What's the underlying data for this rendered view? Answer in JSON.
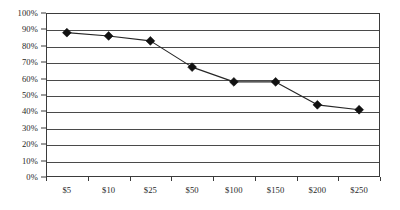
{
  "chart_data": {
    "type": "line",
    "title": "",
    "subtitle": "",
    "xlabel": "",
    "ylabel": "",
    "categories": [
      "$5",
      "$10",
      "$25",
      "$50",
      "$100",
      "$150",
      "$200",
      "$250"
    ],
    "values": [
      88,
      86,
      83,
      67,
      58,
      58,
      44,
      41
    ],
    "value_unit": "%",
    "series": [
      {
        "name": "",
        "values": [
          88,
          86,
          83,
          67,
          58,
          58,
          44,
          41
        ]
      }
    ],
    "ylim": [
      0,
      100
    ],
    "ytick_labels": [
      "0%",
      "10%",
      "20%",
      "30%",
      "40%",
      "50%",
      "60%",
      "70%",
      "80%",
      "90%",
      "100%"
    ],
    "ytick_values": [
      0,
      10,
      20,
      30,
      40,
      50,
      60,
      70,
      80,
      90,
      100
    ],
    "xtick_labels": [
      "$5",
      "$10",
      "$25",
      "$50",
      "$100",
      "$150",
      "$200",
      "$250"
    ],
    "grid": "horizontal",
    "legend": "none",
    "marker": "diamond",
    "colors": {
      "line": "#262626",
      "marker": "#111111",
      "gridline": "#4a4a4a",
      "frame": "#3b3b3b",
      "background": "#ffffff",
      "text": "#1f1f1f"
    },
    "annotations": []
  }
}
